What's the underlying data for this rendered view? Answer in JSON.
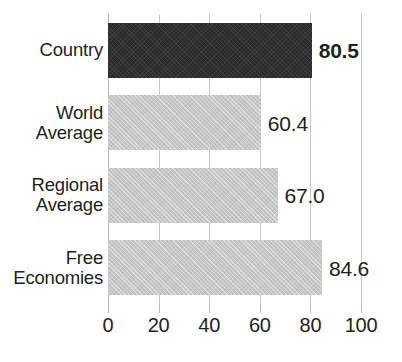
{
  "chart_data": {
    "type": "bar",
    "orientation": "horizontal",
    "title": "",
    "subtitle": "",
    "xlabel": "",
    "ylabel": "",
    "xlim": [
      0,
      100
    ],
    "xticks": [
      0,
      20,
      40,
      60,
      80,
      100
    ],
    "xtick_labels": [
      "0",
      "20",
      "40",
      "60",
      "80",
      "100"
    ],
    "grid": true,
    "legend": false,
    "categories": [
      "Country",
      "World Average",
      "Regional Average",
      "Free Economies"
    ],
    "values": [
      80.5,
      60.4,
      67.0,
      84.6
    ],
    "value_labels": [
      "80.5",
      "60.4",
      "67.0",
      "84.6"
    ],
    "bars": [
      {
        "category": "Country",
        "label_lines": [
          "Country"
        ],
        "value": 80.5,
        "value_label": "80.5",
        "color": "#2a2a2a",
        "highlighted": true,
        "value_label_bold": true
      },
      {
        "category": "World Average",
        "label_lines": [
          "World",
          "Average"
        ],
        "value": 60.4,
        "value_label": "60.4",
        "color": "#c7c7c7",
        "highlighted": false,
        "value_label_bold": false
      },
      {
        "category": "Regional Average",
        "label_lines": [
          "Regional",
          "Average"
        ],
        "value": 67.0,
        "value_label": "67.0",
        "color": "#c7c7c7",
        "highlighted": false,
        "value_label_bold": false
      },
      {
        "category": "Free Economies",
        "label_lines": [
          "Free",
          "Economies"
        ],
        "value": 84.6,
        "value_label": "84.6",
        "color": "#c7c7c7",
        "highlighted": false,
        "value_label_bold": false
      }
    ],
    "colors": {
      "highlight_bar": "#2a2a2a",
      "default_bar": "#c7c7c7",
      "gridline": "#c9c9c9",
      "text": "#231f20",
      "background": "#ffffff"
    }
  }
}
